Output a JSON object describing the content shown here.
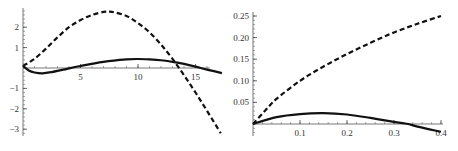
{
  "chart_data": [
    {
      "type": "line",
      "title": "",
      "xlabel": "",
      "ylabel": "",
      "xlim": [
        0,
        17.3
      ],
      "ylim": [
        -3.3,
        2.9
      ],
      "grid": false,
      "legend": null,
      "x_ticks": [
        5,
        10,
        15
      ],
      "x_tick_labels": [
        "5",
        "10",
        "15"
      ],
      "y_ticks": [
        2,
        1,
        -1,
        -2,
        -3
      ],
      "y_tick_labels": [
        "2",
        "1",
        "-1",
        "-2",
        "-3"
      ],
      "series": [
        {
          "name": "dashed",
          "style": "dashed",
          "x": [
            0,
            1,
            2,
            3,
            4,
            5,
            6,
            7,
            7.5,
            8,
            9,
            10,
            11,
            12,
            13,
            14,
            15,
            16,
            17.2
          ],
          "values": [
            0.1,
            0.45,
            0.95,
            1.5,
            2.0,
            2.35,
            2.6,
            2.75,
            2.76,
            2.72,
            2.55,
            2.2,
            1.75,
            1.15,
            0.45,
            -0.35,
            -1.2,
            -2.1,
            -3.2
          ]
        },
        {
          "name": "solid",
          "style": "solid",
          "x": [
            0,
            0.5,
            1,
            1.7,
            2.5,
            3.5,
            5,
            7,
            9,
            10,
            11,
            12,
            13,
            14,
            15,
            16,
            17.3
          ],
          "values": [
            0.1,
            -0.12,
            -0.22,
            -0.26,
            -0.2,
            -0.08,
            0.1,
            0.3,
            0.42,
            0.44,
            0.42,
            0.38,
            0.3,
            0.2,
            0.07,
            -0.08,
            -0.25
          ]
        }
      ]
    },
    {
      "type": "line",
      "title": "",
      "xlabel": "",
      "ylabel": "",
      "xlim": [
        0,
        0.4
      ],
      "ylim": [
        -0.02,
        0.26
      ],
      "grid": false,
      "legend": null,
      "x_ticks": [
        0.1,
        0.2,
        0.3,
        0.4
      ],
      "x_tick_labels": [
        "0.1",
        "0.2",
        "0.3",
        "0.4"
      ],
      "y_ticks": [
        0.25,
        0.2,
        0.15,
        0.1,
        0.05
      ],
      "y_tick_labels": [
        "0.25",
        "0.20",
        "0.15",
        "0.10",
        "0.05"
      ],
      "series": [
        {
          "name": "dashed",
          "style": "dashed",
          "x": [
            0,
            0.025,
            0.05,
            0.1,
            0.15,
            0.2,
            0.25,
            0.3,
            0.35,
            0.4
          ],
          "values": [
            0,
            0.03,
            0.058,
            0.1,
            0.133,
            0.162,
            0.188,
            0.212,
            0.232,
            0.25
          ]
        },
        {
          "name": "solid",
          "style": "solid",
          "x": [
            0,
            0.05,
            0.1,
            0.15,
            0.2,
            0.25,
            0.3,
            0.33,
            0.35,
            0.4
          ],
          "values": [
            0,
            0.016,
            0.023,
            0.025,
            0.022,
            0.014,
            0.005,
            0,
            -0.006,
            -0.018
          ]
        }
      ]
    }
  ]
}
